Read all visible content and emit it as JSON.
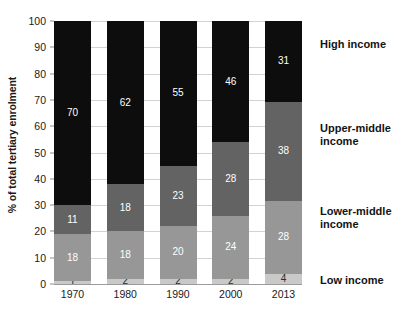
{
  "chart_data": {
    "type": "bar",
    "subtype": "stacked-bar-100",
    "title": "",
    "subtitle": "",
    "xlabel": "",
    "ylabel": "% of total tertiary enrolment",
    "categories": [
      "1970",
      "1980",
      "1990",
      "2000",
      "2013"
    ],
    "ylim": [
      0,
      100
    ],
    "ytick_labels": [
      "0",
      "10",
      "20",
      "30",
      "40",
      "50",
      "60",
      "70",
      "80",
      "90",
      "100"
    ],
    "ytick_values": [
      0,
      10,
      20,
      30,
      40,
      50,
      60,
      70,
      80,
      90,
      100
    ],
    "grid": true,
    "grid_axis": "y",
    "legend_position": "right-aligned-to-segments",
    "series": [
      {
        "name": "Low income",
        "color": "#c9c9c9",
        "label_color": "#2b2b2b",
        "values": [
          1,
          2,
          2,
          2,
          4
        ]
      },
      {
        "name": "Lower-middle income",
        "color": "#979797",
        "label_color": "#ffffff",
        "values": [
          18,
          18,
          20,
          24,
          28
        ]
      },
      {
        "name": "Upper-middle income",
        "color": "#636363",
        "label_color": "#ffffff",
        "values": [
          11,
          18,
          23,
          28,
          38
        ]
      },
      {
        "name": "High income",
        "color": "#0d0d0d",
        "label_color": "#ffffff",
        "values": [
          70,
          62,
          55,
          46,
          31
        ]
      }
    ],
    "legend_entries": [
      {
        "label": "High income",
        "top": 38
      },
      {
        "label": "Upper-middle income",
        "top": 122
      },
      {
        "label": "Lower-middle income",
        "top": 205
      },
      {
        "label": "Low income",
        "top": 274
      }
    ],
    "annotations": []
  }
}
